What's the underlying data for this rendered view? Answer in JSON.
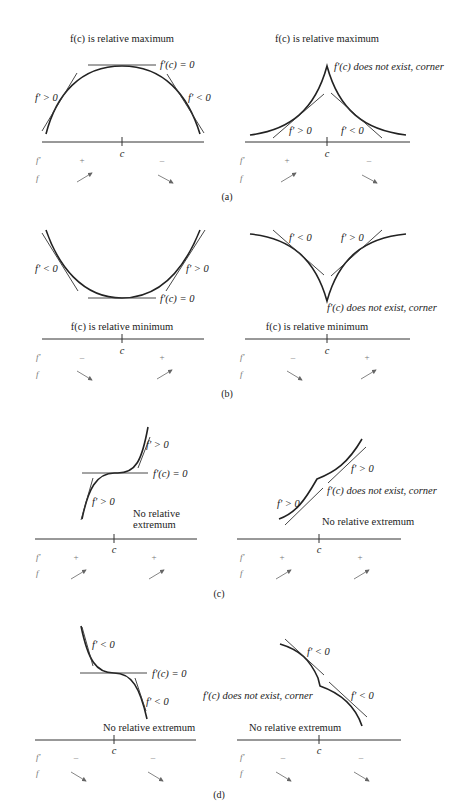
{
  "figure": {
    "panels": [
      {
        "id": "a",
        "caption": "(a)",
        "left": {
          "title": "f(c) is relative maximum",
          "title_parts": [
            "f",
            "(",
            "c",
            ") is relative maximum"
          ],
          "labels": {
            "left": "f' > 0",
            "right": "f' < 0",
            "point": "f'(c) = 0"
          },
          "axis_label": "c",
          "sign_row": {
            "label": "f'",
            "left": "+",
            "right": "–"
          },
          "trend_row": {
            "label": "f",
            "left": "increasing",
            "right": "decreasing"
          }
        },
        "right": {
          "title": "f(c) is relative maximum",
          "labels": {
            "left": "f' > 0",
            "right": "f' < 0",
            "point": "f'(c) does not exist, corner"
          },
          "axis_label": "c",
          "sign_row": {
            "label": "f'",
            "left": "+",
            "right": "–"
          },
          "trend_row": {
            "label": "f",
            "left": "increasing",
            "right": "decreasing"
          }
        }
      },
      {
        "id": "b",
        "caption": "(b)",
        "left": {
          "title": "f(c) is relative minimum",
          "labels": {
            "left": "f' < 0",
            "right": "f' > 0",
            "point": "f'(c) = 0"
          },
          "axis_label": "c",
          "sign_row": {
            "label": "f'",
            "left": "–",
            "right": "+"
          },
          "trend_row": {
            "label": "f",
            "left": "decreasing",
            "right": "increasing"
          }
        },
        "right": {
          "title": "f(c) is relative minimum",
          "labels": {
            "left": "f' < 0",
            "right": "f' > 0",
            "point": "f'(c) does not exist, corner"
          },
          "axis_label": "c",
          "sign_row": {
            "label": "f'",
            "left": "–",
            "right": "+"
          },
          "trend_row": {
            "label": "f",
            "left": "decreasing",
            "right": "increasing"
          }
        }
      },
      {
        "id": "c",
        "caption": "(c)",
        "left": {
          "title": "No relative extremum",
          "title_lines": [
            "No relative",
            "extremum"
          ],
          "labels": {
            "left": "f' > 0",
            "right": "f' > 0",
            "point": "f'(c) = 0"
          },
          "axis_label": "c",
          "sign_row": {
            "label": "f'",
            "left": "+",
            "right": "+"
          },
          "trend_row": {
            "label": "f",
            "left": "increasing",
            "right": "increasing"
          }
        },
        "right": {
          "title": "No relative extremum",
          "labels": {
            "left": "f' > 0",
            "right": "f' > 0",
            "point": "f'(c) does not exist, corner"
          },
          "axis_label": "c",
          "sign_row": {
            "label": "f'",
            "left": "+",
            "right": "+"
          },
          "trend_row": {
            "label": "f",
            "left": "increasing",
            "right": "increasing"
          }
        }
      },
      {
        "id": "d",
        "caption": "(d)",
        "left": {
          "title": "No relative extremum",
          "labels": {
            "left": "f' < 0",
            "right": "f' < 0",
            "point": "f'(c) = 0"
          },
          "axis_label": "c",
          "sign_row": {
            "label": "f'",
            "left": "–",
            "right": "–"
          },
          "trend_row": {
            "label": "f",
            "left": "decreasing",
            "right": "decreasing"
          }
        },
        "right": {
          "title": "No relative extremum",
          "labels": {
            "left": "f' < 0",
            "right": "f' < 0",
            "point": "f'(c) does not exist, corner"
          },
          "axis_label": "c",
          "sign_row": {
            "label": "f'",
            "left": "–",
            "right": "–"
          },
          "trend_row": {
            "label": "f",
            "left": "decreasing",
            "right": "decreasing"
          }
        }
      }
    ]
  },
  "colors": {
    "ink": "#222222",
    "muted": "#777777",
    "background": "#ffffff"
  }
}
